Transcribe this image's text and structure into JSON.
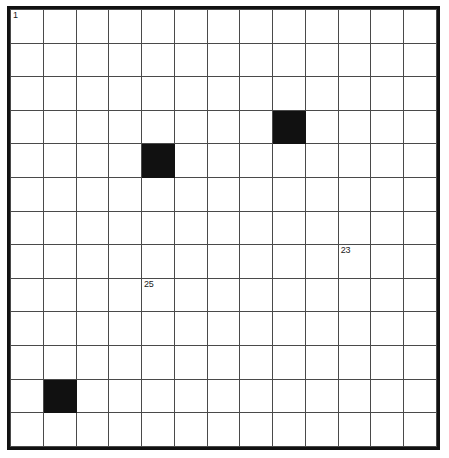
{
  "puzzle": {
    "title": "Crossword Grid",
    "type": "crossword-grid",
    "rows": 13,
    "cols": 13,
    "colors": {
      "background": "#ffffff",
      "cell_fill": "#ffffff",
      "block_fill": "#111111",
      "grid_line": "#4a4a4a",
      "outer_border": "#111111",
      "number_text": "#1a1a1a"
    },
    "geometry": {
      "grid_left": 7,
      "grid_top": 6,
      "grid_width": 433,
      "grid_height": 444,
      "outer_border_width": 3,
      "cell_line_width": 1
    },
    "blocks": [
      {
        "row": 3,
        "col": 8
      },
      {
        "row": 4,
        "col": 4
      },
      {
        "row": 11,
        "col": 1
      }
    ],
    "numbers": [
      {
        "row": 0,
        "col": 0,
        "label": "1"
      },
      {
        "row": 7,
        "col": 10,
        "label": "23"
      },
      {
        "row": 8,
        "col": 4,
        "label": "25"
      }
    ],
    "cells": [
      [
        {
          "n": "1"
        },
        {},
        {},
        {},
        {},
        {},
        {},
        {},
        {},
        {},
        {},
        {},
        {}
      ],
      [
        {},
        {},
        {},
        {},
        {},
        {},
        {},
        {},
        {},
        {},
        {},
        {},
        {}
      ],
      [
        {},
        {},
        {},
        {},
        {},
        {},
        {},
        {},
        {},
        {},
        {},
        {},
        {}
      ],
      [
        {},
        {},
        {},
        {},
        {},
        {},
        {},
        {},
        {
          "b": true
        },
        {},
        {},
        {},
        {}
      ],
      [
        {},
        {},
        {},
        {},
        {
          "b": true
        },
        {},
        {},
        {},
        {},
        {},
        {},
        {},
        {}
      ],
      [
        {},
        {},
        {},
        {},
        {},
        {},
        {},
        {},
        {},
        {},
        {},
        {},
        {}
      ],
      [
        {},
        {},
        {},
        {},
        {},
        {},
        {},
        {},
        {},
        {},
        {},
        {},
        {}
      ],
      [
        {},
        {},
        {},
        {},
        {},
        {},
        {},
        {},
        {},
        {},
        {
          "n": "23"
        },
        {},
        {}
      ],
      [
        {},
        {},
        {},
        {},
        {
          "n": "25"
        },
        {},
        {},
        {},
        {},
        {},
        {},
        {},
        {}
      ],
      [
        {},
        {},
        {},
        {},
        {},
        {},
        {},
        {},
        {},
        {},
        {},
        {},
        {}
      ],
      [
        {},
        {},
        {},
        {},
        {},
        {},
        {},
        {},
        {},
        {},
        {},
        {},
        {}
      ],
      [
        {},
        {
          "b": true
        },
        {},
        {},
        {},
        {},
        {},
        {},
        {},
        {},
        {},
        {},
        {}
      ],
      [
        {},
        {},
        {},
        {},
        {},
        {},
        {},
        {},
        {},
        {},
        {},
        {},
        {}
      ]
    ]
  }
}
